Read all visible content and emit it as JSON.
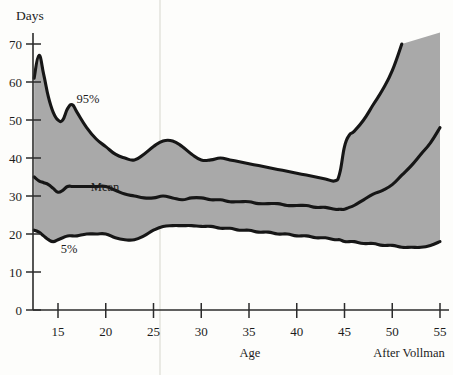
{
  "figure": {
    "unit_label": "Days",
    "x_axis_title": "Age",
    "credit": "After Vollman",
    "background_color": "#fdfdfb",
    "band_color": "#a9a9a9",
    "line_color": "#161616"
  },
  "labels": {
    "upper": "95%",
    "mean": "Mean",
    "lower": "5%"
  },
  "ticks": {
    "y": [
      "0",
      "10",
      "20",
      "30",
      "40",
      "50",
      "60",
      "70"
    ],
    "x": [
      "15",
      "20",
      "25",
      "30",
      "35",
      "40",
      "45",
      "50",
      "55"
    ]
  },
  "chart_data": {
    "type": "area",
    "title": "",
    "subtitle": "",
    "xlabel": "Age",
    "ylabel": "Days",
    "unit": "Days",
    "xlim": [
      12.5,
      55
    ],
    "ylim": [
      0,
      73
    ],
    "grid": false,
    "legend_position": "inline-annotations",
    "annotations": [
      {
        "text": "95%",
        "x": 16.7,
        "y": 55.5
      },
      {
        "text": "Mean",
        "x": 20.6,
        "y": 33.5
      },
      {
        "text": "5%",
        "x": 15.5,
        "y": 16.5
      },
      {
        "text": "After Vollman",
        "x": 50.5,
        "y": -9
      }
    ],
    "x": [
      12.5,
      13,
      13.5,
      14,
      14.5,
      15,
      15.5,
      16,
      16.5,
      17,
      18,
      19,
      20,
      21,
      22,
      23,
      24,
      25,
      26,
      27,
      28,
      29,
      30,
      31,
      32,
      33,
      34,
      35,
      36,
      37,
      38,
      39,
      40,
      41,
      42,
      43,
      44,
      44.5,
      45,
      45.5,
      46,
      47,
      48,
      49,
      50,
      51,
      52,
      53,
      54,
      55
    ],
    "series": [
      {
        "name": "95%",
        "label": "95th percentile",
        "values": [
          61,
          67,
          62,
          56,
          52,
          50,
          50,
          53,
          54,
          52,
          48,
          45,
          43,
          41,
          40,
          39.5,
          41,
          43,
          44.5,
          44.5,
          43,
          41,
          39.5,
          39.5,
          40,
          39.5,
          39,
          38.5,
          38,
          37.5,
          37,
          36.5,
          36,
          35.5,
          35,
          34.5,
          34,
          36,
          43,
          46,
          47,
          50,
          54,
          58,
          63,
          70,
          null,
          null,
          null,
          null
        ]
      },
      {
        "name": "Mean",
        "label": "Mean",
        "values": [
          35,
          34,
          33.5,
          33,
          32,
          31,
          31.5,
          32.5,
          32.5,
          32.5,
          32.5,
          32.5,
          32.5,
          31.5,
          30.5,
          30,
          29.5,
          29.5,
          30,
          29.5,
          29,
          29.5,
          29.5,
          29,
          29,
          28.5,
          28.5,
          28.5,
          28,
          28,
          28,
          27.5,
          27.5,
          27.5,
          27,
          27,
          26.5,
          26.5,
          26.5,
          27,
          27.5,
          29,
          30.5,
          31.5,
          33,
          35.5,
          38,
          41,
          44,
          48
        ]
      },
      {
        "name": "5%",
        "label": "5th percentile",
        "values": [
          21,
          20.5,
          19.5,
          18.5,
          18,
          18.5,
          19,
          19.5,
          19.5,
          19.5,
          20,
          20,
          20,
          19,
          18.5,
          18.5,
          19.5,
          21,
          22,
          22.2,
          22.2,
          22.2,
          22,
          22,
          21.5,
          21.5,
          21,
          21,
          20.5,
          20.5,
          20,
          20,
          19.5,
          19.5,
          19,
          19,
          18.5,
          18.5,
          18,
          18,
          18,
          17.5,
          17.5,
          17,
          17,
          16.5,
          16.5,
          16.5,
          17,
          18
        ]
      }
    ]
  }
}
